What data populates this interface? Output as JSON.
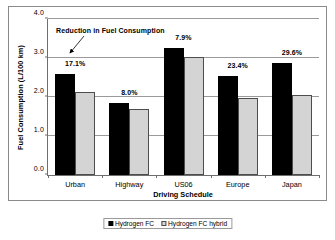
{
  "chart_data": {
    "type": "bar",
    "title": "",
    "xlabel": "Driving Schedule",
    "ylabel": "Fuel Consumption (L/100 km)",
    "categories": [
      "Urban",
      "Highway",
      "US06",
      "Europe",
      "Japan"
    ],
    "ylim": [
      0.0,
      4.0
    ],
    "yticks": [
      "0.0",
      "1.0",
      "2.0",
      "3.0",
      "4.0"
    ],
    "ytick_values": [
      0.0,
      1.0,
      2.0,
      3.0,
      4.0
    ],
    "grid": true,
    "legend_position": "bottom",
    "series": [
      {
        "name": "Hydrogen FC",
        "color": "#000000",
        "values": [
          2.58,
          1.84,
          3.25,
          2.55,
          2.86
        ]
      },
      {
        "name": "Hydrogen FC hybrid",
        "color": "#d4d4d4",
        "values": [
          2.14,
          1.69,
          3.02,
          1.98,
          2.04
        ]
      }
    ],
    "data_labels": [
      "17.1%",
      "8.0%",
      "7.9%",
      "23.4%",
      "29.6%"
    ],
    "annotations": [
      {
        "text": "Reduction in Fuel Consumption",
        "points_to": "Urban group"
      }
    ]
  },
  "legend": {
    "items": [
      {
        "label": "Hydrogen FC",
        "color": "#000000"
      },
      {
        "label": "Hydrogen FC hybrid",
        "color": "#d4d4d4"
      }
    ]
  }
}
